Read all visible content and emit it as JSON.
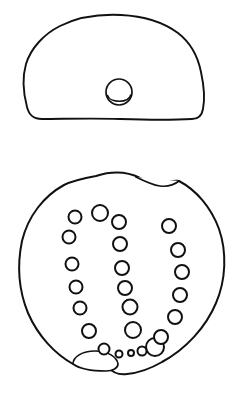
{
  "plate": {
    "title": "Artifact line drawing plate",
    "background_color": "#ffffff",
    "ink_color": "#111111",
    "width": 243,
    "height": 399,
    "views": [
      {
        "id": "profile-view",
        "label": "Profile view (side elevation)",
        "description": "Dome-shaped outline with a small circular boss near the lower centre",
        "outline": {
          "type": "dome",
          "bbox": [
            22,
            15,
            183,
            105
          ],
          "stroke_width": 1.9
        },
        "features": [
          {
            "id": "boss-circle",
            "label": "Circular boss with crescent shading",
            "cx": 119,
            "cy": 92,
            "rx": 13,
            "ry": 12,
            "stroke_width": 1.7
          },
          {
            "id": "boss-crescent",
            "label": "Crescent arc inside boss",
            "stroke_width": 1.7
          }
        ]
      },
      {
        "id": "plan-view",
        "label": "Plan view (top / underside)",
        "description": "Circular outline with two lug notches and a horseshoe arrangement of perforations",
        "outline": {
          "type": "circle-irregular",
          "bbox": [
            18,
            172,
            207,
            203
          ],
          "stroke_width": 2.0
        },
        "features": [
          {
            "id": "lug-top",
            "label": "Top lug / spout notch",
            "stroke_width": 1.7
          },
          {
            "id": "lug-bottom",
            "label": "Bottom lug / handle stub",
            "stroke_width": 1.7
          }
        ]
      }
    ]
  },
  "perforations": {
    "label": "Perforation holes arranged in a horseshoe (U) pattern",
    "stroke_width": 2.0,
    "groups": [
      {
        "id": "left-arc",
        "label": "Left outer arc of perforations",
        "count": 7,
        "circles": [
          {
            "n": 1,
            "cx": 75,
            "cy": 217,
            "r": 6.5
          },
          {
            "n": 2,
            "cx": 69,
            "cy": 237,
            "r": 6.5
          },
          {
            "n": 3,
            "cx": 72,
            "cy": 264,
            "r": 6.5
          },
          {
            "n": 4,
            "cx": 76,
            "cy": 287,
            "r": 6.5
          },
          {
            "n": 5,
            "cx": 80,
            "cy": 308,
            "r": 6.5
          },
          {
            "n": 6,
            "cx": 89,
            "cy": 331,
            "r": 7.0
          },
          {
            "n": 7,
            "cx": 100,
            "cy": 213,
            "r": 8.0
          }
        ]
      },
      {
        "id": "inner-arc",
        "label": "Inner arc of perforations",
        "count": 7,
        "circles": [
          {
            "n": 1,
            "cx": 119,
            "cy": 222,
            "r": 7.0
          },
          {
            "n": 2,
            "cx": 120,
            "cy": 244,
            "r": 7.0
          },
          {
            "n": 3,
            "cx": 122,
            "cy": 268,
            "r": 7.0
          },
          {
            "n": 4,
            "cx": 125,
            "cy": 288,
            "r": 7.0
          },
          {
            "n": 5,
            "cx": 130,
            "cy": 307,
            "r": 7.5
          },
          {
            "n": 6,
            "cx": 133,
            "cy": 330,
            "r": 8.0
          },
          {
            "n": 7,
            "cx": 155,
            "cy": 347,
            "r": 9.0
          }
        ]
      },
      {
        "id": "right-arc",
        "label": "Right outer arc of perforations",
        "count": 6,
        "circles": [
          {
            "n": 1,
            "cx": 169,
            "cy": 226,
            "r": 7.0
          },
          {
            "n": 2,
            "cx": 178,
            "cy": 250,
            "r": 7.0
          },
          {
            "n": 3,
            "cx": 182,
            "cy": 272,
            "r": 7.0
          },
          {
            "n": 4,
            "cx": 180,
            "cy": 295,
            "r": 7.0
          },
          {
            "n": 5,
            "cx": 175,
            "cy": 317,
            "r": 7.0
          },
          {
            "n": 6,
            "cx": 161,
            "cy": 337,
            "r": 7.0
          }
        ]
      },
      {
        "id": "bottom-row",
        "label": "Small perforations along the bottom",
        "count": 4,
        "circles": [
          {
            "n": 1,
            "cx": 104,
            "cy": 349,
            "r": 5.5
          },
          {
            "n": 2,
            "cx": 119,
            "cy": 354,
            "r": 3.5
          },
          {
            "n": 3,
            "cx": 131,
            "cy": 353,
            "r": 3.0
          },
          {
            "n": 4,
            "cx": 142,
            "cy": 351,
            "r": 4.5
          }
        ]
      }
    ]
  }
}
